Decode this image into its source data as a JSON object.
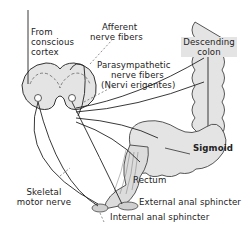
{
  "figure": {
    "colors": {
      "ink": "#222222",
      "tissue": "#e4e4e4",
      "background": "#ffffff"
    },
    "labels": {
      "from_cortex": [
        "From",
        "conscious",
        "cortex"
      ],
      "afferent": [
        "Afferent",
        "nerve fibers"
      ],
      "parasympathetic": [
        "Parasympathetic",
        "nerve fibers",
        "(Nervi erigentes)"
      ],
      "descending_colon": [
        "Descending",
        "colon"
      ],
      "sigmoid": "Sigmoid",
      "rectum": "Rectum",
      "skeletal_motor": [
        "Skeletal",
        "motor nerve"
      ],
      "external_sphincter": "External anal sphincter",
      "internal_sphincter": "Internal anal sphincter"
    }
  }
}
